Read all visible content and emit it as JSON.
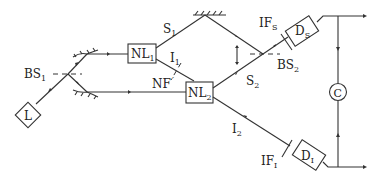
{
  "diagram": {
    "type": "optical-setup",
    "components": {
      "laser": {
        "label": "L",
        "sub": ""
      },
      "bs1": {
        "label": "BS",
        "sub": "1"
      },
      "nl1": {
        "label": "NL",
        "sub": "1"
      },
      "nl2": {
        "label": "NL",
        "sub": "2"
      },
      "bs2": {
        "label": "BS",
        "sub": "2"
      },
      "ds": {
        "label": "D",
        "sub": "S"
      },
      "di": {
        "label": "D",
        "sub": "I"
      },
      "ifs": {
        "label": "IF",
        "sub": "S"
      },
      "ifi": {
        "label": "IF",
        "sub": "I"
      },
      "nf": {
        "label": "NF",
        "sub": ""
      },
      "coincidence": {
        "label": "C"
      }
    },
    "beams": {
      "s1": {
        "label": "S",
        "sub": "1"
      },
      "s2": {
        "label": "S",
        "sub": "2"
      },
      "i1": {
        "label": "I",
        "sub": "1"
      },
      "i2": {
        "label": "I",
        "sub": "2"
      }
    }
  }
}
